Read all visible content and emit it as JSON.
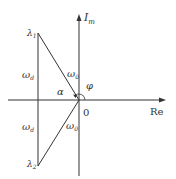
{
  "diagram": {
    "axes": {
      "imag_label_main": "I",
      "imag_label_sub": "m",
      "real_label": "Re",
      "origin_label": "0"
    },
    "points": {
      "lambda1_main": "λ",
      "lambda1_sub": "1",
      "lambda2_main": "λ",
      "lambda2_sub": "2"
    },
    "labels": {
      "omega_d_upper_main": "ω",
      "omega_d_upper_sub": "d",
      "omega_d_lower_main": "ω",
      "omega_d_lower_sub": "d",
      "omega_0_upper_main": "ω",
      "omega_0_upper_sub": "0",
      "omega_0_lower_main": "ω",
      "omega_0_lower_sub": "0",
      "alpha": "α",
      "phi": "φ"
    },
    "colors": {
      "line": "#333333",
      "background": "#ffffff"
    }
  }
}
